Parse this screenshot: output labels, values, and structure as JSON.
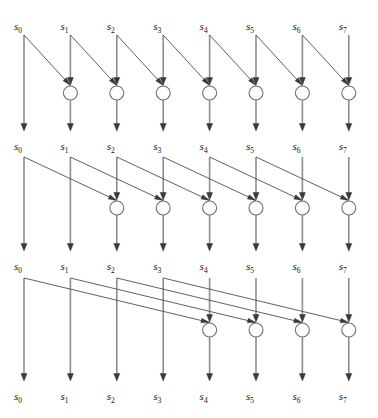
{
  "diagram": {
    "type": "dataflow-network",
    "element_symbol": "s",
    "lane_count": 8,
    "lane_indices": [
      0,
      1,
      2,
      3,
      4,
      5,
      6,
      7
    ],
    "colors": {
      "background": "#ffffff",
      "lane_line": "#8d8d8d",
      "diagonal_line": "#4f4f4f",
      "arrowhead": "#3a3a3a",
      "node_stroke": "#6f6f6f",
      "node_fill": "#ffffff",
      "label_text": "#111111"
    },
    "geometry": {
      "width": 378,
      "height": 418,
      "lane_x": [
        24,
        70.4,
        116.8,
        163.2,
        209.6,
        256,
        302.4,
        348.8
      ],
      "label_offset_x": -10,
      "node_radius": 7,
      "lane_stroke_width": 1.6,
      "diagonal_stroke_width": 0.9
    },
    "label_rows": [
      {
        "name": "input-row",
        "y": 30,
        "labels": [
          "s0",
          "s1",
          "s2",
          "s3",
          "s4",
          "s5",
          "s6",
          "s7"
        ]
      },
      {
        "name": "stage-1-output-row",
        "y": 150,
        "labels": [
          "s0",
          "s1",
          "s2",
          "s3",
          "s4",
          "s5",
          "s6",
          "s7"
        ]
      },
      {
        "name": "stage-2-output-row",
        "y": 270,
        "labels": [
          "s0",
          "s1",
          "s2",
          "s3",
          "s4",
          "s5",
          "s6",
          "s7"
        ]
      },
      {
        "name": "stage-3-output-row",
        "y": 400,
        "labels": [
          "s0",
          "s1",
          "s2",
          "s3",
          "s4",
          "s5",
          "s6",
          "s7"
        ]
      }
    ],
    "stages": [
      {
        "name": "stage-1",
        "offset": 1,
        "line_top_y": 35,
        "node_center_y": 93,
        "arrow_in_y": 85,
        "arrow_out_y": 131,
        "node_lanes": [
          1,
          2,
          3,
          4,
          5,
          6,
          7
        ],
        "passthrough_lanes": [
          0
        ],
        "edges": [
          {
            "from": 0,
            "to": 1
          },
          {
            "from": 1,
            "to": 2
          },
          {
            "from": 2,
            "to": 3
          },
          {
            "from": 3,
            "to": 4
          },
          {
            "from": 4,
            "to": 5
          },
          {
            "from": 5,
            "to": 6
          },
          {
            "from": 6,
            "to": 7
          }
        ]
      },
      {
        "name": "stage-2",
        "offset": 2,
        "line_top_y": 157,
        "node_center_y": 208,
        "arrow_in_y": 200,
        "arrow_out_y": 251,
        "node_lanes": [
          2,
          3,
          4,
          5,
          6,
          7
        ],
        "passthrough_lanes": [
          0,
          1
        ],
        "edges": [
          {
            "from": 0,
            "to": 2
          },
          {
            "from": 1,
            "to": 3
          },
          {
            "from": 2,
            "to": 4
          },
          {
            "from": 3,
            "to": 5
          },
          {
            "from": 4,
            "to": 6
          },
          {
            "from": 5,
            "to": 7
          }
        ]
      },
      {
        "name": "stage-3",
        "offset": 4,
        "line_top_y": 278,
        "node_center_y": 330,
        "arrow_in_y": 322,
        "arrow_out_y": 381,
        "node_lanes": [
          4,
          5,
          6,
          7
        ],
        "passthrough_lanes": [
          0,
          1,
          2,
          3
        ],
        "edges": [
          {
            "from": 0,
            "to": 4
          },
          {
            "from": 1,
            "to": 5
          },
          {
            "from": 2,
            "to": 6
          },
          {
            "from": 3,
            "to": 7
          }
        ]
      }
    ]
  }
}
